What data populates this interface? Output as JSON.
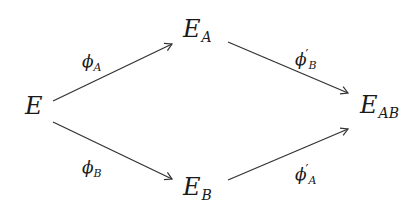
{
  "diagram": {
    "type": "commutative-square",
    "nodes": [
      {
        "id": "E",
        "base": "E",
        "sub": ""
      },
      {
        "id": "EA",
        "base": "E",
        "sub": "A"
      },
      {
        "id": "EB",
        "base": "E",
        "sub": "B"
      },
      {
        "id": "EAB",
        "base": "E",
        "sub": "AB"
      }
    ],
    "edges": [
      {
        "from": "E",
        "to": "EA",
        "label_base": "ϕ",
        "label_prime": "",
        "label_sub": "A"
      },
      {
        "from": "E",
        "to": "EB",
        "label_base": "ϕ",
        "label_prime": "",
        "label_sub": "B"
      },
      {
        "from": "EA",
        "to": "EAB",
        "label_base": "ϕ",
        "label_prime": "′",
        "label_sub": "B"
      },
      {
        "from": "EB",
        "to": "EAB",
        "label_base": "ϕ",
        "label_prime": "′",
        "label_sub": "A"
      }
    ],
    "stroke_color": "#333333"
  }
}
